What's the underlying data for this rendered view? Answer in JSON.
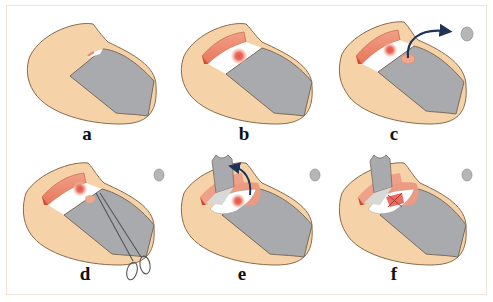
{
  "figure": {
    "colors": {
      "skin": "#f6d2a8",
      "skin_outline": "#8a6a4a",
      "nail_plate": "#a9aaad",
      "nail_bed_exposed": "#ffffff",
      "proximal_fold": "#ee8a6a",
      "lesion": "#e3554a",
      "lesion_halo": "#f4a08c",
      "arrow": "#1e3358",
      "excised_disc": "#b5b6b8",
      "frame_border": "#f1e4da"
    },
    "panels": [
      {
        "id": "a",
        "label": "a",
        "content": "fingertip with intact nail plate"
      },
      {
        "id": "b",
        "label": "b",
        "content": "proximal nail plate reflected, lesion visible on nail bed"
      },
      {
        "id": "c",
        "label": "c",
        "content": "punch biopsy disc removed from nail plate (arrow)"
      },
      {
        "id": "d",
        "label": "d",
        "content": "scissors/forceps inserted under nail plate"
      },
      {
        "id": "e",
        "label": "e",
        "content": "nail plate flap lifted (curved arrow)"
      },
      {
        "id": "f",
        "label": "f",
        "content": "lesion excised on nail bed"
      }
    ]
  }
}
